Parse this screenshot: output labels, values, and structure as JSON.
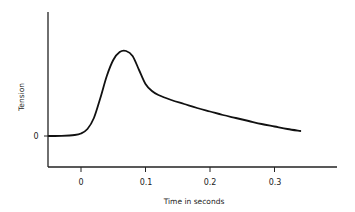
{
  "chart_data": {
    "type": "line",
    "title": "",
    "xlabel": "Time in seconds",
    "ylabel": "Tension",
    "x_ticks": [
      0,
      0.1,
      0.2,
      0.3
    ],
    "x_tick_labels": [
      "0",
      "0.1",
      "0.2",
      "0.3"
    ],
    "y_ticks": [
      0
    ],
    "y_tick_labels": [
      "0"
    ],
    "xlim": [
      -0.05,
      0.4
    ],
    "ylim": [
      -48,
      124
    ],
    "grid": false,
    "legend": null,
    "series": [
      {
        "name": "Tension",
        "x": [
          -0.05,
          -0.03,
          -0.01,
          0.0,
          0.01,
          0.02,
          0.03,
          0.04,
          0.05,
          0.06,
          0.07,
          0.08,
          0.09,
          0.1,
          0.11,
          0.12,
          0.14,
          0.16,
          0.18,
          0.2,
          0.22,
          0.24,
          0.26,
          0.28,
          0.3,
          0.32,
          0.34
        ],
        "y": [
          0,
          0.2,
          1,
          2.5,
          7,
          18,
          38,
          60,
          76,
          84,
          85,
          80,
          66,
          52,
          45,
          41,
          36,
          32,
          28,
          24.5,
          21,
          18,
          15,
          12,
          9.5,
          7,
          5
        ]
      }
    ]
  },
  "labels": {
    "ylabel": "Tension",
    "xlabel": "Time in seconds",
    "y_zero": "0",
    "x0": "0",
    "x1": "0.1",
    "x2": "0.2",
    "x3": "0.3"
  }
}
